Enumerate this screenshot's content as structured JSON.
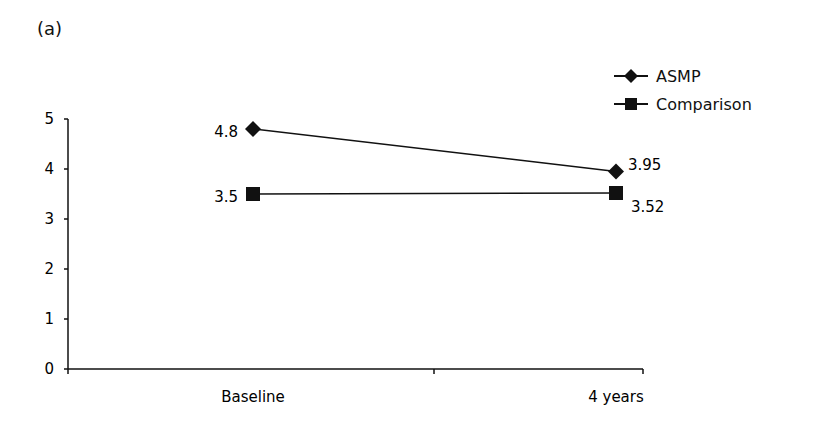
{
  "panel_label": "(a)",
  "chart_data": {
    "type": "line",
    "title": "",
    "xlabel": "",
    "ylabel": "",
    "categories": [
      "Baseline",
      "4 years"
    ],
    "series": [
      {
        "name": "ASMP",
        "marker": "diamond",
        "values": [
          4.8,
          3.95
        ],
        "labels": [
          "4.8",
          "3.95"
        ]
      },
      {
        "name": "Comparison",
        "marker": "square",
        "values": [
          3.5,
          3.52
        ],
        "labels": [
          "3.5",
          "3.52"
        ]
      }
    ],
    "ylim": [
      0,
      5
    ],
    "yticks": [
      "0",
      "1",
      "2",
      "3",
      "4",
      "5"
    ],
    "grid": false,
    "legend_position": "top-right"
  },
  "legend": {
    "items": [
      {
        "label": "ASMP"
      },
      {
        "label": "Comparison"
      }
    ]
  },
  "colors": {
    "line": "#111111",
    "background": "#ffffff"
  }
}
